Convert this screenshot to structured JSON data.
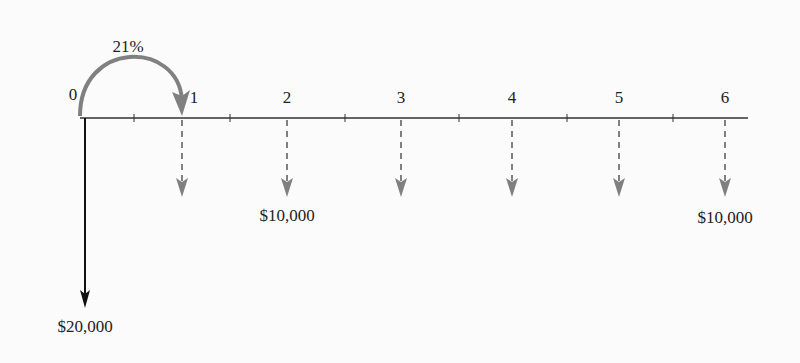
{
  "diagram": {
    "type": "cash-flow-timeline",
    "interest_rate_label": "21%",
    "periods": [
      "0",
      "1",
      "2",
      "3",
      "4",
      "5",
      "6"
    ],
    "initial_outflow": {
      "period": "0",
      "label": "$20,000"
    },
    "annual_outflows": [
      {
        "period": "1",
        "label": ""
      },
      {
        "period": "2",
        "label": "$10,000"
      },
      {
        "period": "3",
        "label": ""
      },
      {
        "period": "4",
        "label": ""
      },
      {
        "period": "5",
        "label": ""
      },
      {
        "period": "6",
        "label": "$10,000"
      }
    ],
    "colors": {
      "axis": "#333333",
      "initial_arrow": "#111111",
      "dashed_arrows": "#808080",
      "rate_arc": "#808080"
    }
  }
}
